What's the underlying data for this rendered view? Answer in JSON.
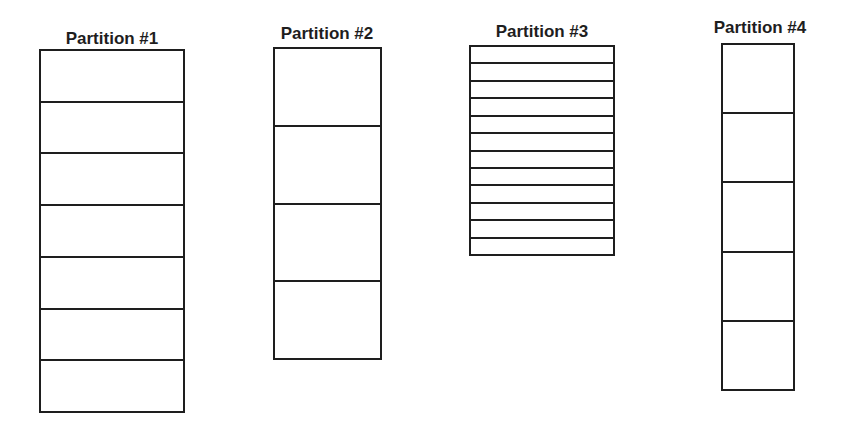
{
  "diagram": {
    "partitions": [
      {
        "title": "Partition #1",
        "cells": 7
      },
      {
        "title": "Partition #2",
        "cells": 4
      },
      {
        "title": "Partition #3",
        "cells": 12
      },
      {
        "title": "Partition #4",
        "cells": 5
      }
    ],
    "colors": {
      "line": "#1e1e1e",
      "background": "#ffffff"
    }
  }
}
